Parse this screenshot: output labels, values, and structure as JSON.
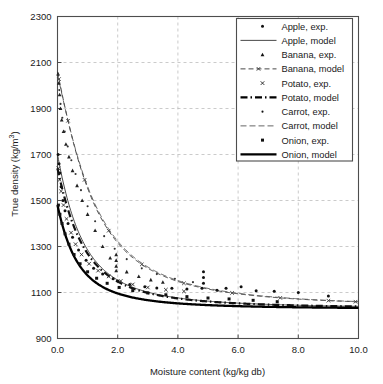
{
  "chart_data": {
    "type": "scatter",
    "title": "",
    "xlabel": "Moisture content (kg/kg db)",
    "ylabel": "True density (kg/m3)",
    "ylabel_prefix": "True density (kg/m",
    "ylabel_sup": "3",
    "ylabel_suffix": ")",
    "xlim": [
      0.0,
      10.0
    ],
    "ylim": [
      900,
      2300
    ],
    "xticks": [
      "0.0",
      "2.0",
      "4.0",
      "6.0",
      "8.0",
      "10.0"
    ],
    "xtick_values": [
      0,
      2,
      4,
      6,
      8,
      10
    ],
    "yticks": [
      "900",
      "1100",
      "1300",
      "1500",
      "1700",
      "1900",
      "2100",
      "2300"
    ],
    "ytick_values": [
      900,
      1100,
      1300,
      1500,
      1700,
      1900,
      2100,
      2300
    ],
    "grid": true,
    "grid_style": "dashed",
    "grid_color": "#b4b4b4",
    "frame_color": "#4d4d4d",
    "legend_position": "upper right",
    "series": [
      {
        "name": "Apple, exp.",
        "kind": "scatter",
        "marker": "dot",
        "color": "#111111",
        "points": [
          [
            0.02,
            1700
          ],
          [
            0.05,
            1660
          ],
          [
            0.08,
            1620
          ],
          [
            0.12,
            1560
          ],
          [
            0.18,
            1500
          ],
          [
            0.25,
            1455
          ],
          [
            0.35,
            1400
          ],
          [
            0.5,
            1340
          ],
          [
            0.7,
            1285
          ],
          [
            0.95,
            1240
          ],
          [
            1.2,
            1205
          ],
          [
            1.5,
            1180
          ],
          [
            1.85,
            1160
          ],
          [
            2.0,
            1150
          ],
          [
            2.4,
            1135
          ],
          [
            2.9,
            1125
          ],
          [
            3.3,
            1120
          ],
          [
            3.8,
            1118
          ],
          [
            4.3,
            1115
          ],
          [
            4.8,
            1118
          ],
          [
            4.85,
            1140
          ],
          [
            4.85,
            1165
          ],
          [
            4.85,
            1190
          ],
          [
            5.3,
            1110
          ],
          [
            5.6,
            1118
          ],
          [
            6.1,
            1125
          ],
          [
            6.6,
            1108
          ],
          [
            7.2,
            1105
          ],
          [
            8.0,
            1100
          ],
          [
            9.0,
            1085
          ]
        ]
      },
      {
        "name": "Apple, model",
        "kind": "line",
        "style": "solid-thin",
        "color": "#333333",
        "y0": 1700,
        "yinf": 1030,
        "k": 1.05
      },
      {
        "name": "Banana, exp.",
        "kind": "scatter",
        "marker": "triangle",
        "color": "#222222",
        "points": [
          [
            0.02,
            2050
          ],
          [
            0.04,
            2010
          ],
          [
            0.07,
            1960
          ],
          [
            0.1,
            1900
          ],
          [
            0.14,
            1850
          ],
          [
            0.2,
            1800
          ],
          [
            0.28,
            1745
          ],
          [
            0.38,
            1690
          ],
          [
            0.5,
            1630
          ],
          [
            0.65,
            1565
          ],
          [
            0.82,
            1500
          ],
          [
            1.0,
            1440
          ],
          [
            1.25,
            1370
          ],
          [
            1.5,
            1300
          ],
          [
            1.75,
            1250
          ],
          [
            1.95,
            1215
          ],
          [
            1.95,
            1240
          ],
          [
            1.95,
            1265
          ],
          [
            1.95,
            1195
          ],
          [
            2.3,
            1190
          ],
          [
            2.7,
            1170
          ],
          [
            3.1,
            1155
          ],
          [
            3.5,
            1145
          ]
        ]
      },
      {
        "name": "Banana, model",
        "kind": "line",
        "style": "dashed-marker",
        "color": "#333333",
        "y0": 2060,
        "yinf": 1035,
        "k": 0.63
      },
      {
        "name": "Potato, exp.",
        "kind": "scatter",
        "marker": "x",
        "color": "#222222",
        "points": [
          [
            0.03,
            1640
          ],
          [
            0.07,
            1590
          ],
          [
            0.12,
            1540
          ],
          [
            0.2,
            1480
          ],
          [
            0.3,
            1420
          ],
          [
            0.45,
            1360
          ],
          [
            0.6,
            1310
          ],
          [
            0.8,
            1265
          ],
          [
            1.05,
            1225
          ],
          [
            1.35,
            1195
          ],
          [
            1.7,
            1170
          ],
          [
            2.1,
            1150
          ],
          [
            2.5,
            1135
          ],
          [
            3.0,
            1122
          ],
          [
            3.6,
            1112
          ],
          [
            4.2,
            1105
          ]
        ]
      },
      {
        "name": "Potato, model",
        "kind": "line",
        "style": "dash-dot-thick",
        "color": "#111111",
        "y0": 1640,
        "yinf": 1030,
        "k": 1.0
      },
      {
        "name": "Carrot, exp.",
        "kind": "scatter",
        "marker": "dot-small",
        "color": "#333333",
        "points": [
          [
            0.02,
            2045
          ],
          [
            0.06,
            1980
          ],
          [
            0.1,
            1920
          ],
          [
            0.16,
            1860
          ],
          [
            0.24,
            1800
          ],
          [
            0.34,
            1735
          ],
          [
            0.46,
            1675
          ],
          [
            0.6,
            1615
          ],
          [
            0.78,
            1545
          ],
          [
            1.0,
            1475
          ],
          [
            1.25,
            1410
          ],
          [
            1.55,
            1345
          ],
          [
            1.9,
            1290
          ],
          [
            2.3,
            1245
          ],
          [
            2.8,
            1205
          ],
          [
            3.3,
            1180
          ],
          [
            3.9,
            1160
          ],
          [
            4.5,
            1145
          ]
        ]
      },
      {
        "name": "Carrot, model",
        "kind": "line",
        "style": "dashed-thin",
        "color": "#555555",
        "y0": 2050,
        "yinf": 1035,
        "k": 0.6
      },
      {
        "name": "Onion, exp.",
        "kind": "scatter",
        "marker": "square",
        "color": "#111111",
        "points": [
          [
            0.03,
            1480
          ],
          [
            0.08,
            1440
          ],
          [
            0.15,
            1400
          ],
          [
            0.25,
            1355
          ],
          [
            0.38,
            1310
          ],
          [
            0.55,
            1265
          ],
          [
            0.75,
            1225
          ],
          [
            1.0,
            1190
          ],
          [
            1.3,
            1162
          ],
          [
            1.65,
            1140
          ],
          [
            2.05,
            1122
          ],
          [
            2.5,
            1108
          ],
          [
            3.0,
            1098
          ],
          [
            3.6,
            1090
          ],
          [
            4.3,
            1082
          ],
          [
            5.0,
            1076
          ],
          [
            5.7,
            1072
          ],
          [
            6.5,
            1066
          ],
          [
            7.3,
            1060
          ]
        ]
      },
      {
        "name": "Onion, model",
        "kind": "line",
        "style": "solid-thick",
        "color": "#000000",
        "y0": 1480,
        "yinf": 1028,
        "k": 1.35
      }
    ]
  },
  "legend": {
    "items": [
      {
        "label": "Apple, exp.",
        "marker": "dot"
      },
      {
        "label": "Apple, model",
        "marker": "solid-thin"
      },
      {
        "label": "Banana, exp.",
        "marker": "triangle"
      },
      {
        "label": "Banana, model",
        "marker": "dashed-marker"
      },
      {
        "label": "Potato, exp.",
        "marker": "x"
      },
      {
        "label": "Potato, model",
        "marker": "dash-dot-thick"
      },
      {
        "label": "Carrot, exp.",
        "marker": "dot-small"
      },
      {
        "label": "Carrot, model",
        "marker": "dashed-thin"
      },
      {
        "label": "Onion, exp.",
        "marker": "square"
      },
      {
        "label": "Onion, model",
        "marker": "solid-thick"
      }
    ]
  }
}
